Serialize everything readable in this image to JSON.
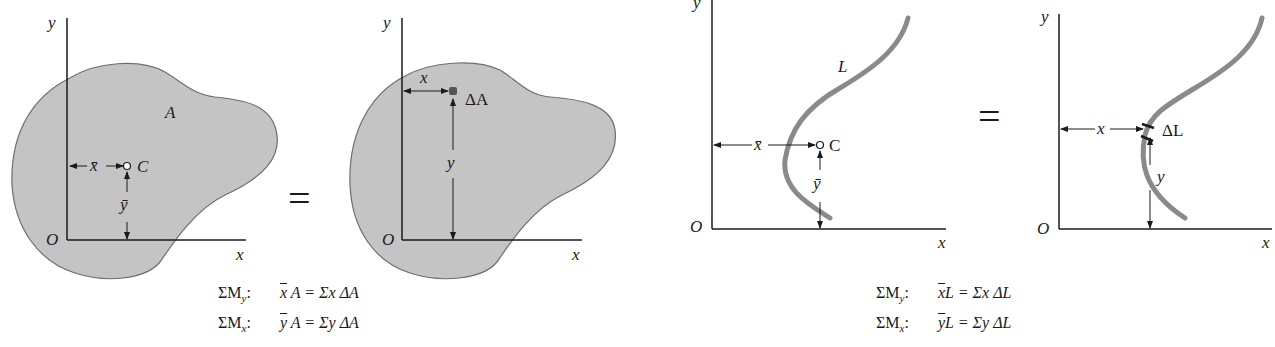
{
  "figure": {
    "colors": {
      "area_fill": "#c4c4c4",
      "area_stroke": "#6e6e6e",
      "curve": "#8a8a8a",
      "axis": "#1a1a1a"
    },
    "panel_area_centroid": {
      "axis_x": "x",
      "axis_y": "y",
      "origin": "O",
      "area_label": "A",
      "centroid_label": "C",
      "xbar_label": "x̄",
      "ybar_label": "ȳ"
    },
    "equals_sign_1": "=",
    "panel_area_element": {
      "axis_x": "x",
      "axis_y": "y",
      "origin": "O",
      "element_label": "ΔA",
      "x_label": "x",
      "y_label": "y"
    },
    "panel_line_centroid": {
      "axis_x": "x",
      "axis_y": "y",
      "origin": "O",
      "line_label": "L",
      "centroid_label": "C",
      "xbar_label": "x̄",
      "ybar_label": "ȳ"
    },
    "equals_sign_2": "=",
    "panel_line_element": {
      "axis_x": "x",
      "axis_y": "y",
      "origin": "O",
      "element_label": "ΔL",
      "x_label": "x",
      "y_label": "y"
    }
  },
  "equations": {
    "area": [
      {
        "lhs": "ΣM",
        "sub": "y",
        "colon": ":",
        "bar": "x",
        "rest": " A = Σx ΔA"
      },
      {
        "lhs": "ΣM",
        "sub": "x",
        "colon": ":",
        "bar": "y",
        "rest": " A = Σy ΔA"
      }
    ],
    "line": [
      {
        "lhs": "ΣM",
        "sub": "y",
        "colon": ":",
        "bar": "x",
        "rest": "L = Σx ΔL"
      },
      {
        "lhs": "ΣM",
        "sub": "x",
        "colon": ":",
        "bar": "y",
        "rest": "L = Σy ΔL"
      }
    ]
  }
}
